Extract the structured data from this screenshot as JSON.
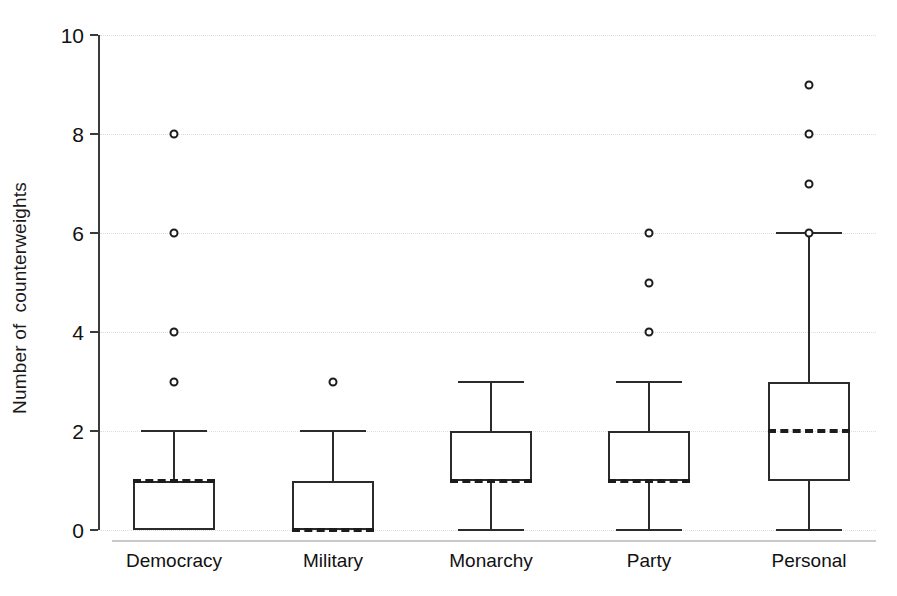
{
  "chart_data": {
    "type": "box",
    "title": "",
    "xlabel": "",
    "ylabel": "Number of  counterweights",
    "ylim": [
      0,
      10
    ],
    "yticks": [
      0,
      2,
      4,
      6,
      8,
      10
    ],
    "ytick_labels": [
      "0",
      "2",
      "4",
      "6",
      "8",
      "10"
    ],
    "grid": true,
    "legend": "none",
    "categories": [
      "Democracy",
      "Military",
      "Monarchy",
      "Party",
      "Personal"
    ],
    "boxes": [
      {
        "label": "Democracy",
        "whisker_low": 0,
        "q1": 0,
        "median": 1,
        "q3": 1,
        "whisker_high": 2,
        "outliers": [
          3,
          4,
          6,
          8
        ]
      },
      {
        "label": "Military",
        "whisker_low": 0,
        "q1": 0,
        "median": 0,
        "q3": 1,
        "whisker_high": 2,
        "outliers": [
          3
        ]
      },
      {
        "label": "Monarchy",
        "whisker_low": 0,
        "q1": 1,
        "median": 1,
        "q3": 2,
        "whisker_high": 3,
        "outliers": []
      },
      {
        "label": "Party",
        "whisker_low": 0,
        "q1": 1,
        "median": 1,
        "q3": 2,
        "whisker_high": 3,
        "outliers": [
          4,
          5,
          6
        ]
      },
      {
        "label": "Personal",
        "whisker_low": 0,
        "q1": 1,
        "median": 2,
        "q3": 3,
        "whisker_high": 6,
        "outliers": [
          6,
          7,
          8,
          9
        ]
      }
    ],
    "colors": {
      "box_stroke": "#2b2b2b",
      "median_stroke": "#1c1c1c",
      "outlier_stroke": "#1c1c1c",
      "axis": "#3b3b3b",
      "grid": "#dddddd",
      "background": "#ffffff"
    }
  },
  "geometry": {
    "plot_left": 100,
    "plot_right": 876,
    "y_top_px": 35,
    "y_bottom_px": 530,
    "x_axis_px": 540,
    "box_half_width": 41,
    "whisker_cap_half_width": 33,
    "category_centers": [
      174,
      333,
      491,
      649,
      809
    ]
  }
}
